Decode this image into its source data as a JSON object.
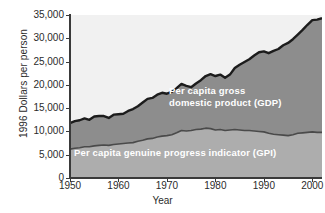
{
  "chart_data": {
    "type": "area",
    "title": "",
    "xlabel": "Year",
    "ylabel": "1996 Dollars per person",
    "xlim": [
      1950,
      2002
    ],
    "ylim": [
      0,
      35000
    ],
    "grid": false,
    "legend_position": "in-plot annotations",
    "xticks": [
      1950,
      1960,
      1970,
      1980,
      1990,
      2000
    ],
    "xtick_labels": [
      "1950",
      "1960",
      "1970",
      "1980",
      "1990",
      "2000"
    ],
    "yticks": [
      0,
      5000,
      10000,
      15000,
      20000,
      25000,
      30000,
      35000
    ],
    "ytick_labels": [
      "0",
      "5,000",
      "10,000",
      "15,000",
      "20,000",
      "25,000",
      "30,000",
      "35,000"
    ],
    "annotations": [
      {
        "name": "gdp-annotation",
        "text_line1": "Per capita gross",
        "text_line2": "domestic product (GDP)"
      },
      {
        "name": "gpi-annotation",
        "text_line1": "Per capita genuine progress indicator (GPI)"
      }
    ],
    "colors": {
      "plot_background": "#f1f1f1",
      "gdp_band_fill": "#8d8d8d",
      "gpi_band_fill": "#adadad",
      "gdp_line": "#1c1c1c",
      "gpi_line": "#4a4a4a",
      "axis": "#3a3a3a",
      "text": "#2b2b2b",
      "annotation_text": "#ffffff"
    },
    "x": [
      1950,
      1951,
      1952,
      1953,
      1954,
      1955,
      1956,
      1957,
      1958,
      1959,
      1960,
      1961,
      1962,
      1963,
      1964,
      1965,
      1966,
      1967,
      1968,
      1969,
      1970,
      1971,
      1972,
      1973,
      1974,
      1975,
      1976,
      1977,
      1978,
      1979,
      1980,
      1981,
      1982,
      1983,
      1984,
      1985,
      1986,
      1987,
      1988,
      1989,
      1990,
      1991,
      1992,
      1993,
      1994,
      1995,
      1996,
      1997,
      1998,
      1999,
      2000,
      2001,
      2002
    ],
    "series": [
      {
        "name": "Per capita gross domestic product (GDP)",
        "values": [
          11800,
          12200,
          12400,
          12800,
          12500,
          13200,
          13300,
          13300,
          12900,
          13600,
          13700,
          13800,
          14400,
          14800,
          15400,
          16200,
          17000,
          17200,
          17900,
          18300,
          18100,
          18500,
          19300,
          20200,
          19800,
          19500,
          20300,
          21000,
          21900,
          22300,
          21900,
          22200,
          21500,
          22200,
          23600,
          24300,
          24900,
          25500,
          26300,
          27000,
          27200,
          26800,
          27300,
          27700,
          28500,
          29000,
          29800,
          30800,
          31800,
          32900,
          33900,
          34000,
          34300
        ]
      },
      {
        "name": "Per capita genuine progress indicator (GPI)",
        "values": [
          6200,
          6400,
          6500,
          6700,
          6700,
          6900,
          7000,
          7100,
          7000,
          7200,
          7300,
          7400,
          7500,
          7600,
          7900,
          8100,
          8400,
          8500,
          8800,
          9000,
          9100,
          9300,
          9700,
          10200,
          10100,
          10200,
          10400,
          10500,
          10700,
          10600,
          10300,
          10400,
          10200,
          10300,
          10400,
          10300,
          10200,
          10200,
          10100,
          10000,
          9900,
          9600,
          9400,
          9300,
          9200,
          9100,
          9300,
          9600,
          9700,
          9800,
          9900,
          9800,
          9800
        ]
      }
    ]
  }
}
